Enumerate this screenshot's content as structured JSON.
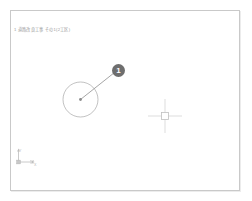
{
  "app": {
    "name": "cad-drawing-viewer",
    "background_color": "#ffffff",
    "sheet_border_color": "#c9c9c9"
  },
  "sheet": {
    "title_note": "1 道路改良工事 その1(2工区)"
  },
  "drawing": {
    "entity_color": "#a0a0a0",
    "circle": {
      "label": "circle-entity",
      "center_x": "80.5",
      "center_y": "99.5",
      "radius": "17.5"
    },
    "center_point": {
      "label": "center-grip-point",
      "x": "80.5",
      "y": "99.5"
    },
    "leader": {
      "label": "leader-line",
      "from_x": "80.5",
      "from_y": "99.5",
      "to_x": "116.0",
      "to_y": "71.5"
    },
    "balloon": {
      "label": "balloon-callout",
      "number": "1",
      "fill_color": "#6e6e6e",
      "text_color": "#ffffff",
      "x": "118.5",
      "y": "70.5",
      "radius": "6.5"
    }
  },
  "cursor": {
    "label": "crosshair-cursor",
    "x": "165",
    "y": "116",
    "arm_length": "17",
    "pickbox_size": "7",
    "color": "#c4c4c4"
  },
  "ucs_icon": {
    "label": "ucs-axis-icon",
    "origin_x": "18",
    "origin_y": "162",
    "axis_x_label": "X",
    "axis_y_label": "Y",
    "color": "#b5b5b5"
  }
}
